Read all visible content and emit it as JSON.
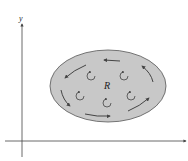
{
  "diagram": {
    "type": "region-circulation",
    "axes": {
      "x_label": "",
      "y_label": "y"
    },
    "region": {
      "label": "R",
      "fill": "#c8c8c8",
      "stroke": "#555555"
    },
    "boundary_orientation": "counterclockwise",
    "interior_circulations": 6,
    "colors": {
      "axis": "#444444",
      "arrow": "#444444",
      "region_fill": "#c8c8c8"
    }
  }
}
